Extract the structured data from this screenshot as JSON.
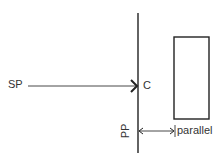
{
  "diagram": {
    "labels": {
      "source_point": "SP",
      "contact": "C",
      "picture_plane": "PP",
      "parallel": "parallel"
    },
    "colors": {
      "stroke": "#222222",
      "background": "#ffffff"
    }
  }
}
